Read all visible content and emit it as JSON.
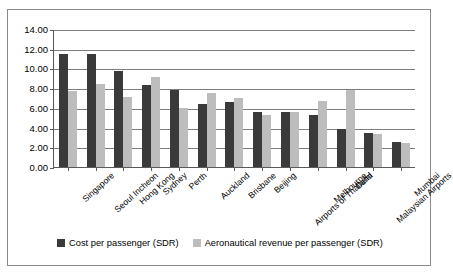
{
  "chart_data": {
    "type": "bar",
    "title": "",
    "xlabel": "",
    "ylabel": "",
    "ylim": [
      0,
      14
    ],
    "ytick_step": 2,
    "yticks": [
      "14.00",
      "12.00",
      "10.00",
      "8.00",
      "6.00",
      "4.00",
      "2.00",
      "0.00"
    ],
    "grid": true,
    "legend_position": "bottom",
    "categories": [
      "Singapore",
      "Seoul Incheon",
      "Hong Kong",
      "Sydney",
      "Perth",
      "Auckland",
      "Brisbane",
      "Beijing",
      "Airports of Thailand",
      "Melbourne",
      "Delhi",
      "Malaysian Airports",
      "Mumbai"
    ],
    "series": [
      {
        "name": "Cost per passenger (SDR)",
        "color": "#3a3a3a",
        "values": [
          11.5,
          11.5,
          9.75,
          8.35,
          7.8,
          6.35,
          6.6,
          5.55,
          5.55,
          5.25,
          3.9,
          3.5,
          2.5
        ]
      },
      {
        "name": "Aeronautical revenue per passenger (SDR)",
        "color": "#bdbdbd",
        "values": [
          7.7,
          8.45,
          7.1,
          9.1,
          5.95,
          7.55,
          7.0,
          5.25,
          5.55,
          6.7,
          7.8,
          3.4,
          2.45
        ]
      }
    ]
  },
  "legend": {
    "items": [
      {
        "label": "Cost per passenger (SDR)"
      },
      {
        "label": "Aeronautical revenue per passenger (SDR)"
      }
    ]
  }
}
